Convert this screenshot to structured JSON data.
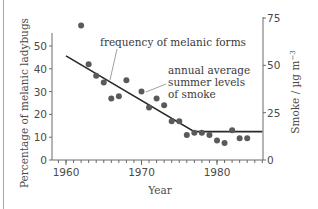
{
  "chart_data": {
    "type": "scatter",
    "title": "",
    "xlabel": "Year",
    "ylabel": "Percentage of melanic ladybugs",
    "y2label": "Smoke / µg m⁻³",
    "xlim": [
      1958,
      1987
    ],
    "ylim": [
      0,
      62
    ],
    "y2lim": [
      0,
      75
    ],
    "x_ticks": [
      1960,
      1970,
      1980
    ],
    "y_ticks": [
      0,
      10,
      20,
      30,
      40,
      50
    ],
    "y2_ticks": [
      0,
      25,
      50,
      75
    ],
    "grid": false,
    "legend": "none",
    "series": [
      {
        "name": "frequency of melanic forms",
        "type": "scatter",
        "axis": "left",
        "color": "#5a5a5a",
        "points": [
          {
            "x": 1962,
            "y": 59
          },
          {
            "x": 1963,
            "y": 42
          },
          {
            "x": 1964,
            "y": 37
          },
          {
            "x": 1965,
            "y": 34
          },
          {
            "x": 1966,
            "y": 27
          },
          {
            "x": 1967,
            "y": 28
          },
          {
            "x": 1968,
            "y": 35
          },
          {
            "x": 1970,
            "y": 30
          },
          {
            "x": 1971,
            "y": 23
          },
          {
            "x": 1972,
            "y": 27
          },
          {
            "x": 1973,
            "y": 24
          },
          {
            "x": 1974,
            "y": 17
          },
          {
            "x": 1975,
            "y": 17
          },
          {
            "x": 1976,
            "y": 11
          },
          {
            "x": 1977,
            "y": 12
          },
          {
            "x": 1978,
            "y": 12
          },
          {
            "x": 1979,
            "y": 11
          },
          {
            "x": 1980,
            "y": 8.5
          },
          {
            "x": 1981,
            "y": 7.5
          },
          {
            "x": 1982,
            "y": 13
          },
          {
            "x": 1983,
            "y": 9.5
          },
          {
            "x": 1984,
            "y": 9.5
          }
        ]
      },
      {
        "name": "annual average summer levels of smoke",
        "type": "line",
        "axis": "right",
        "color": "#2a2a2a",
        "points": [
          {
            "x": 1960,
            "y": 55
          },
          {
            "x": 1977,
            "y": 15
          },
          {
            "x": 1986,
            "y": 15
          }
        ]
      }
    ],
    "annotations": [
      {
        "text": "frequency of melanic forms",
        "target_series": 0
      },
      {
        "text": "annual average summer levels of smoke",
        "target_series": 1
      }
    ]
  },
  "labels": {
    "xlabel": "Year",
    "ylabel": "Percentage of melanic ladybugs",
    "y2label_main": "Smoke / µg m",
    "y2label_sup": "−3",
    "annotation_freq": "frequency of melanic forms",
    "annotation_smoke_1": "annual average",
    "annotation_smoke_2": "summer levels",
    "annotation_smoke_3": "of smoke"
  }
}
